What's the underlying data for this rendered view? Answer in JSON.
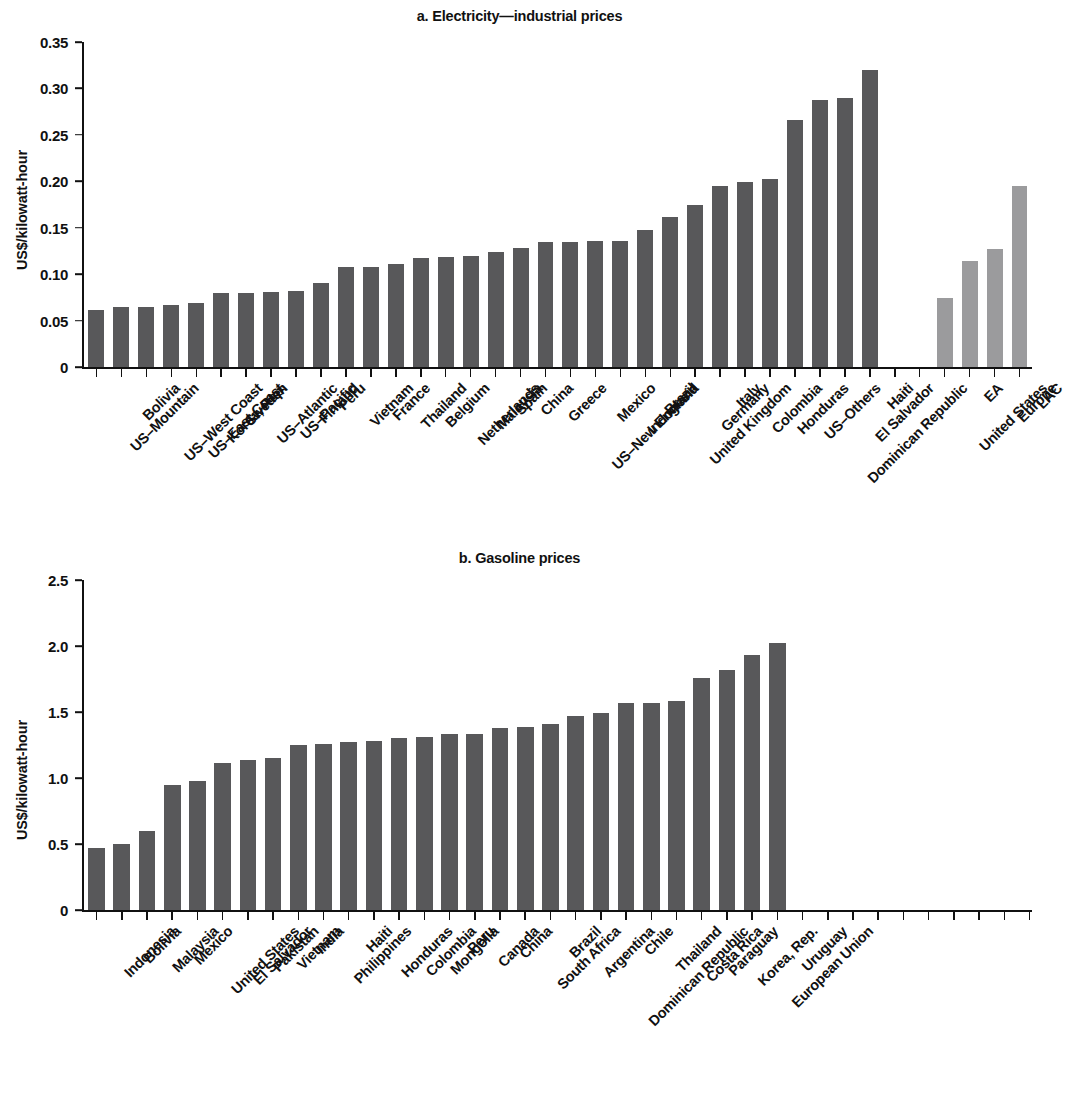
{
  "figure": {
    "colors": {
      "bar_country": "#58585a",
      "bar_aggregate": "#9b9b9d",
      "axis": "#111111",
      "background": "#ffffff"
    }
  },
  "chart_data": [
    {
      "type": "bar",
      "title": "a. Electricity—industrial prices",
      "xlabel": "",
      "ylabel": "US$/kilowatt-hour",
      "ylim": [
        0,
        0.35
      ],
      "ytick_labels": [
        "0",
        "0.05",
        "0.10",
        "0.15",
        "0.20",
        "0.25",
        "0.30",
        "0.35"
      ],
      "ytick_values": [
        0,
        0.05,
        0.1,
        0.15,
        0.2,
        0.25,
        0.3,
        0.35
      ],
      "grid": false,
      "legend": "none",
      "categories": [
        "US–Mountain",
        "Bolivia",
        "US–West Coast",
        "US–East Coast",
        "Korea, Rep.",
        "Sweden",
        "US–Atlantic",
        "US–Pacific",
        "Finland",
        "Peru",
        "Vietnam",
        "France",
        "Thailand",
        "Belgium",
        "Netherlands",
        "Malaysia",
        "Spain",
        "China",
        "Greece",
        "US–New England",
        "Mexico",
        "Indonesia",
        "Brazil",
        "United Kingdom",
        "Germany",
        "Italy",
        "Colombia",
        "Honduras",
        "US–Others",
        "Dominican Republic",
        "El Salvador",
        "Haiti"
      ],
      "values": [
        0.061,
        0.065,
        0.065,
        0.067,
        0.069,
        0.08,
        0.08,
        0.081,
        0.082,
        0.091,
        0.108,
        0.108,
        0.111,
        0.117,
        0.118,
        0.12,
        0.124,
        0.128,
        0.135,
        0.135,
        0.136,
        0.136,
        0.148,
        0.162,
        0.174,
        0.195,
        0.199,
        0.202,
        0.266,
        0.288,
        0.29,
        0.32
      ],
      "aggregate_categories": [
        "United States",
        "EA",
        "Europe",
        "LAC"
      ],
      "aggregate_values": [
        0.074,
        0.114,
        0.127,
        0.195
      ]
    },
    {
      "type": "bar",
      "title": "b. Gasoline prices",
      "xlabel": "",
      "ylabel": "US$/kilowatt-hour",
      "ylim": [
        0,
        2.5
      ],
      "ytick_labels": [
        "0",
        "0.5",
        "1.0",
        "1.5",
        "2.0",
        "2.5"
      ],
      "ytick_values": [
        0,
        0.5,
        1.0,
        1.5,
        2.0,
        2.5
      ],
      "grid": false,
      "legend": "none",
      "categories": [
        "Indonesia",
        "Bolivia",
        "Malaysia",
        "Mexico",
        "United States",
        "El Salvador",
        "Pakistan",
        "Vietnam",
        "India",
        "Philippines",
        "Haiti",
        "Honduras",
        "Colombia",
        "Mongolia",
        "Peru",
        "Canada",
        "China",
        "South Africa",
        "Brazil",
        "Argentina",
        "Dominican Republic",
        "Chile",
        "Thailand",
        "Costa Rica",
        "Paraguay",
        "Korea, Rep.",
        "European Union",
        "Uruguay"
      ],
      "values": [
        0.47,
        0.5,
        0.6,
        0.95,
        0.98,
        1.11,
        1.14,
        1.15,
        1.25,
        1.26,
        1.27,
        1.28,
        1.3,
        1.31,
        1.33,
        1.33,
        1.38,
        1.39,
        1.41,
        1.47,
        1.49,
        1.57,
        1.57,
        1.58,
        1.76,
        1.82,
        1.93,
        2.02
      ],
      "aggregate_categories": [
        "MENA",
        "SA",
        "EA",
        "Middle income",
        "LAC",
        "SSA",
        "ECA",
        "High Income"
      ],
      "aggregate_values": [
        0.55,
        1.24,
        1.26,
        1.3,
        1.35,
        1.37,
        1.46,
        1.82
      ]
    }
  ]
}
